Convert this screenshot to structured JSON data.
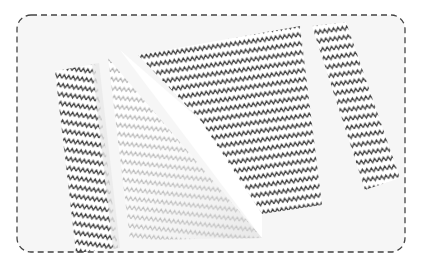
{
  "image": {
    "description": "Photo of chevron (zigzag) patterned paper strips and a folded paper triangle on a white surface, framed by a dashed rounded border",
    "colors": {
      "background": "#f7f7f7",
      "paper": "#ffffff",
      "chevron_dark": "#3a3a3a",
      "chevron_faded": "#9a9a9a",
      "border": "#444444"
    },
    "objects": [
      "left-chevron-strip",
      "folded-triangle",
      "large-chevron-sheet",
      "right-chevron-strip"
    ]
  }
}
